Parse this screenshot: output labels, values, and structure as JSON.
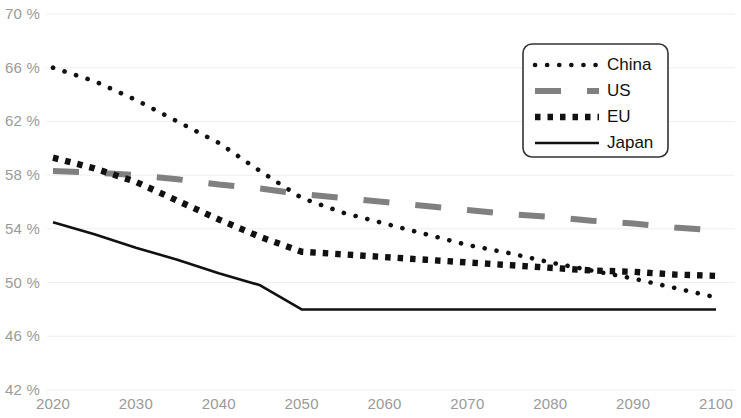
{
  "chart_data": {
    "type": "line",
    "title": "",
    "subtitle": "",
    "xlabel": "",
    "ylabel": "",
    "xlim": [
      2020,
      2100
    ],
    "ylim": [
      42,
      70
    ],
    "grid": true,
    "legend_position": "top-right",
    "x_ticks": [
      "2020",
      "2030",
      "2040",
      "2050",
      "2060",
      "2070",
      "2080",
      "2090",
      "2100"
    ],
    "x_tick_values": [
      2020,
      2030,
      2040,
      2050,
      2060,
      2070,
      2080,
      2090,
      2100
    ],
    "y_ticks": [
      "42 %",
      "46 %",
      "50 %",
      "54 %",
      "58 %",
      "62 %",
      "66 %",
      "70 %"
    ],
    "y_tick_values": [
      42,
      46,
      50,
      54,
      58,
      62,
      66,
      70
    ],
    "x": [
      2020,
      2025,
      2030,
      2035,
      2040,
      2045,
      2050,
      2055,
      2060,
      2065,
      2070,
      2075,
      2080,
      2085,
      2090,
      2095,
      2100
    ],
    "series": [
      {
        "name": "China",
        "style": "dotted",
        "color": "#111111",
        "values": [
          66.0,
          65.0,
          63.6,
          62.0,
          60.4,
          58.3,
          56.3,
          55.2,
          54.4,
          53.6,
          52.8,
          52.2,
          51.5,
          50.9,
          50.3,
          49.6,
          48.9
        ]
      },
      {
        "name": "US",
        "style": "dashed",
        "color": "#808080",
        "values": [
          58.3,
          58.2,
          58.0,
          57.7,
          57.3,
          57.0,
          56.6,
          56.3,
          56.0,
          55.7,
          55.4,
          55.1,
          54.9,
          54.6,
          54.4,
          54.1,
          53.9
        ]
      },
      {
        "name": "EU",
        "style": "square-dotted",
        "color": "#111111",
        "values": [
          59.3,
          58.5,
          57.5,
          56.1,
          54.7,
          53.4,
          52.3,
          52.1,
          51.9,
          51.7,
          51.5,
          51.3,
          51.1,
          50.9,
          50.8,
          50.6,
          50.5
        ]
      },
      {
        "name": "Japan",
        "style": "solid",
        "color": "#111111",
        "values": [
          54.5,
          53.6,
          52.6,
          51.7,
          50.7,
          49.8,
          48.0,
          48.0,
          48.0,
          48.0,
          48.0,
          48.0,
          48.0,
          48.0,
          48.0,
          48.0,
          48.0
        ]
      }
    ],
    "legend": [
      {
        "label": "China",
        "style": "dotted",
        "color": "#111111"
      },
      {
        "label": "US",
        "style": "dashed",
        "color": "#808080"
      },
      {
        "label": "EU",
        "style": "square-dotted",
        "color": "#111111"
      },
      {
        "label": "Japan",
        "style": "solid",
        "color": "#111111"
      }
    ]
  }
}
